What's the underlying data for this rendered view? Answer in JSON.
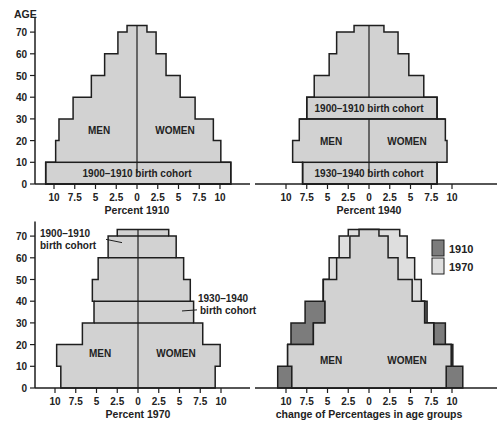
{
  "figure": {
    "age_axis_label": "AGE",
    "age_ticks": [
      0,
      10,
      20,
      30,
      40,
      50,
      60,
      70
    ],
    "percent_ticks": [
      10,
      7.5,
      5,
      2.5,
      0,
      2.5,
      5,
      7.5,
      10
    ],
    "sex_labels": {
      "men": "MEN",
      "women": "WOMEN"
    },
    "colors": {
      "fill": "#d2d2d2",
      "fill_1910": "#7c7c7c",
      "fill_1970": "#dedede",
      "stroke": "#1e1e1e",
      "background": "#ffffff"
    }
  },
  "chart_data": [
    {
      "id": "pyramid-1910",
      "type": "bar",
      "subtype": "population-pyramid",
      "title": "",
      "xlabel": "Percent 1910",
      "ylabel": "AGE",
      "xlim": [
        -10,
        10
      ],
      "ylim": [
        0,
        73
      ],
      "age_groups": [
        "0-10",
        "10-20",
        "20-30",
        "30-40",
        "40-50",
        "50-60",
        "60-70",
        "70+"
      ],
      "series": [
        {
          "name": "MEN",
          "values": [
            11.0,
            9.8,
            9.4,
            7.7,
            5.5,
            3.9,
            2.3,
            1.2
          ]
        },
        {
          "name": "WOMEN",
          "values": [
            11.3,
            10.1,
            9.2,
            7.0,
            5.2,
            3.5,
            2.3,
            1.2
          ]
        }
      ],
      "annotations": [
        {
          "text": "1900–1910 birth cohort",
          "age_band": "0-10",
          "style": "outlined-band"
        }
      ]
    },
    {
      "id": "pyramid-1940",
      "type": "bar",
      "subtype": "population-pyramid",
      "title": "",
      "xlabel": "Percent 1940",
      "ylabel": "",
      "xlim": [
        -10,
        10
      ],
      "ylim": [
        0,
        73
      ],
      "age_groups": [
        "0-10",
        "10-20",
        "20-30",
        "30-40",
        "40-50",
        "50-60",
        "60-70",
        "70+"
      ],
      "series": [
        {
          "name": "MEN",
          "values": [
            8.0,
            9.2,
            8.4,
            7.5,
            6.6,
            4.8,
            3.9,
            1.8
          ]
        },
        {
          "name": "WOMEN",
          "values": [
            8.2,
            9.4,
            9.2,
            8.2,
            6.6,
            4.8,
            3.5,
            1.8
          ]
        }
      ],
      "annotations": [
        {
          "text": "1900–1910 birth cohort",
          "age_band": "30-40",
          "style": "outlined-band"
        },
        {
          "text": "1930–1940 birth cohort",
          "age_band": "0-10",
          "style": "outlined-band"
        }
      ]
    },
    {
      "id": "pyramid-1970",
      "type": "bar",
      "subtype": "population-pyramid",
      "title": "",
      "xlabel": "Percent 1970",
      "ylabel": "",
      "xlim": [
        -10,
        10
      ],
      "ylim": [
        0,
        73
      ],
      "age_groups": [
        "0-10",
        "10-20",
        "20-30",
        "30-40",
        "40-50",
        "50-60",
        "60-70",
        "70+"
      ],
      "series": [
        {
          "name": "MEN",
          "values": [
            9.3,
            9.8,
            6.7,
            5.3,
            5.5,
            4.8,
            3.6,
            2.5
          ]
        },
        {
          "name": "WOMEN",
          "values": [
            9.3,
            9.9,
            7.8,
            6.7,
            6.3,
            5.5,
            4.6,
            3.7
          ]
        }
      ],
      "annotations": [
        {
          "text": "1900–1910\nbirth cohort",
          "age_band": "60-70",
          "style": "callout-left"
        },
        {
          "text": "1930–1940\nbirth cohort",
          "age_band": "30-40",
          "style": "callout-right"
        }
      ]
    },
    {
      "id": "pyramid-change",
      "type": "bar",
      "subtype": "population-pyramid-overlay",
      "title": "",
      "xlabel": "change of Percentages in age groups",
      "ylabel": "",
      "xlim": [
        -10,
        10
      ],
      "ylim": [
        0,
        73
      ],
      "legend": {
        "position": "upper-right",
        "entries": [
          "1910",
          "1970"
        ]
      },
      "age_groups": [
        "0-10",
        "10-20",
        "20-30",
        "30-40",
        "40-50",
        "50-60",
        "60-70",
        "70+"
      ],
      "series": [
        {
          "name": "1910 MEN",
          "values": [
            11.0,
            9.8,
            9.4,
            7.7,
            5.5,
            3.9,
            2.3,
            1.2
          ]
        },
        {
          "name": "1910 WOMEN",
          "values": [
            11.3,
            10.1,
            9.2,
            7.0,
            5.2,
            3.5,
            2.3,
            1.2
          ]
        },
        {
          "name": "1970 MEN",
          "values": [
            9.3,
            9.8,
            6.7,
            5.3,
            5.5,
            4.8,
            3.6,
            2.5
          ]
        },
        {
          "name": "1970 WOMEN",
          "values": [
            9.3,
            9.9,
            7.8,
            6.7,
            6.3,
            5.5,
            4.6,
            3.7
          ]
        }
      ]
    }
  ],
  "panels": [
    {
      "chart": 0,
      "origin_x": 137,
      "baseline_y": 184,
      "show_age_axis": true
    },
    {
      "chart": 1,
      "origin_x": 369,
      "baseline_y": 184,
      "show_age_axis": false
    },
    {
      "chart": 2,
      "origin_x": 138,
      "baseline_y": 388,
      "show_age_axis": true
    },
    {
      "chart": 3,
      "origin_x": 369,
      "baseline_y": 388,
      "show_age_axis": false
    }
  ],
  "labels": {
    "legend_1910": "1910",
    "legend_1970": "1970"
  }
}
